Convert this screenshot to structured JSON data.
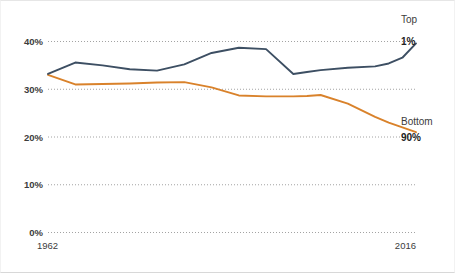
{
  "chart_data": {
    "type": "line",
    "title": "",
    "subtitle": "",
    "xlabel": "",
    "ylabel": "",
    "xlim": [
      1962,
      2016
    ],
    "ylim": [
      0,
      42
    ],
    "grid": true,
    "grid_axis": "y",
    "legend_position": "right-inline",
    "y_ticks": [
      "0%",
      "10%",
      "20%",
      "30%",
      "40%"
    ],
    "y_tick_values": [
      0,
      10,
      20,
      30,
      40
    ],
    "x_ticks": [
      "1962",
      "2016"
    ],
    "x_tick_values": [
      1962,
      2016
    ],
    "x": [
      1962,
      1966,
      1970,
      1974,
      1978,
      1982,
      1986,
      1990,
      1994,
      1998,
      2000,
      2002,
      2006,
      2010,
      2012,
      2014,
      2016
    ],
    "series": [
      {
        "name": "Top 1%",
        "label_line1": "Top",
        "label_line2": "1%",
        "color": "#3d4f63",
        "values": [
          33.2,
          35.6,
          35.0,
          34.2,
          33.9,
          35.2,
          37.6,
          38.7,
          38.4,
          33.2,
          33.6,
          34.0,
          34.5,
          34.8,
          35.4,
          36.6,
          39.6
        ]
      },
      {
        "name": "Bottom 90%",
        "label_line1": "Bottom",
        "label_line2": "90%",
        "color": "#d9822b",
        "values": [
          33.0,
          31.0,
          31.1,
          31.2,
          31.4,
          31.5,
          30.4,
          28.7,
          28.5,
          28.5,
          28.6,
          28.8,
          27.0,
          24.2,
          23.0,
          22.0,
          21.0
        ]
      }
    ],
    "annotations": []
  },
  "axes": {
    "y_labels": [
      {
        "text": "40%",
        "value": 40
      },
      {
        "text": "30%",
        "value": 30
      },
      {
        "text": "20%",
        "value": 20
      },
      {
        "text": "10%",
        "value": 10
      },
      {
        "text": "0%",
        "value": 0
      }
    ],
    "x_labels": [
      {
        "text": "1962",
        "value": 1962
      },
      {
        "text": "2016",
        "value": 2016
      }
    ]
  },
  "labels": {
    "top_series_line1": "Top",
    "top_series_line2": "1%",
    "bottom_series_line1": "Bottom",
    "bottom_series_line2": "90%"
  },
  "colors": {
    "top_line": "#3d4f63",
    "bottom_line": "#d9822b",
    "gridline": "#8c8c8c",
    "text": "#3c3c3c",
    "background": "#ffffff"
  }
}
